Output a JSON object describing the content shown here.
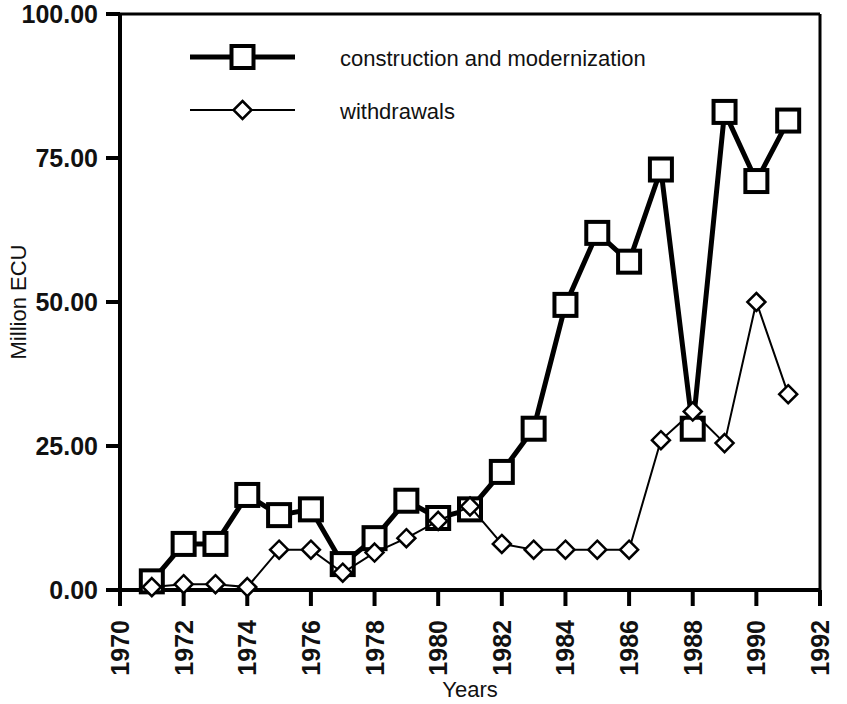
{
  "chart_data": {
    "type": "line",
    "title": "",
    "xlabel": "Years",
    "ylabel": "Million ECU",
    "xlim": [
      1970,
      1992
    ],
    "ylim": [
      0,
      100
    ],
    "xticks": [
      "1970",
      "1972",
      "1974",
      "1976",
      "1978",
      "1980",
      "1982",
      "1984",
      "1986",
      "1988",
      "1990",
      "1992"
    ],
    "yticks": [
      "0.00",
      "25.00",
      "50.00",
      "75.00",
      "100.00"
    ],
    "grid": false,
    "legend_position": "top-left-inside",
    "x": [
      1971,
      1972,
      1973,
      1974,
      1975,
      1976,
      1977,
      1978,
      1979,
      1980,
      1981,
      1982,
      1983,
      1984,
      1985,
      1986,
      1987,
      1988,
      1989,
      1990,
      1991
    ],
    "series": [
      {
        "name": "construction and modernization",
        "marker": "square",
        "line_width": "thick",
        "color": "#000000",
        "values": [
          1.5,
          8.0,
          8.0,
          16.5,
          13.0,
          14.0,
          4.5,
          9.0,
          15.5,
          12.5,
          14.0,
          20.5,
          28.0,
          49.5,
          62.0,
          57.0,
          73.0,
          28.0,
          83.0,
          71.0,
          81.5
        ]
      },
      {
        "name": "withdrawals",
        "marker": "diamond",
        "line_width": "thin",
        "color": "#000000",
        "values": [
          0.5,
          1.0,
          1.0,
          0.5,
          7.0,
          7.0,
          3.0,
          6.5,
          9.0,
          12.0,
          14.5,
          8.0,
          7.0,
          7.0,
          7.0,
          7.0,
          26.0,
          31.0,
          25.5,
          50.0,
          34.0
        ]
      }
    ]
  }
}
